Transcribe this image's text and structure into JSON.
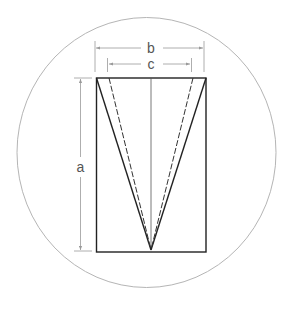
{
  "diagram": {
    "labels": {
      "a": "a",
      "b": "b",
      "c": "c"
    },
    "colors": {
      "circle": "#b5b5b5",
      "outline": "#222222",
      "dimension": "#999999",
      "label": "#555555"
    }
  }
}
